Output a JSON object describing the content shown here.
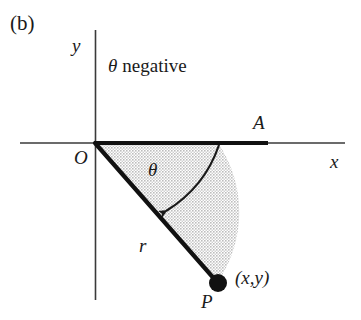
{
  "figure": {
    "panel_label": "(b)",
    "note": {
      "symbol": "θ",
      "text": "negative"
    },
    "axes": {
      "y_label": "y",
      "x_label": "x",
      "origin_label": "O"
    },
    "points": {
      "a_label": "A",
      "p_label": "P",
      "p_coordinates": "(x,y)"
    },
    "angle_label": "θ",
    "radius_label": "r",
    "colors": {
      "ink": "#1a1a1a",
      "line": "#333333",
      "sector_fill": "#d8d8d8",
      "background": "#ffffff"
    }
  }
}
